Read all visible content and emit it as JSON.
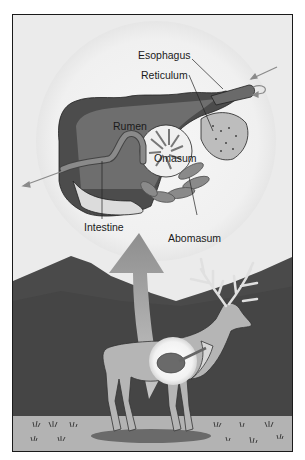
{
  "figure": {
    "labels": {
      "esophagus": "Esophagus",
      "reticulum": "Reticulum",
      "rumen": "Rumen",
      "omasum": "Omasum",
      "intestine": "Intestine",
      "abomasum": "Abomasum"
    },
    "colors": {
      "background": "#ececec",
      "sky": "#e6e6e6",
      "mountains": "#4d4d4d",
      "ground": "#b5b5b5",
      "stomach_dark": "#555555",
      "stomach_mid": "#7a7a7a",
      "highlight_circle": "#f4f4f4",
      "arrow": "#a0a0a0"
    }
  }
}
